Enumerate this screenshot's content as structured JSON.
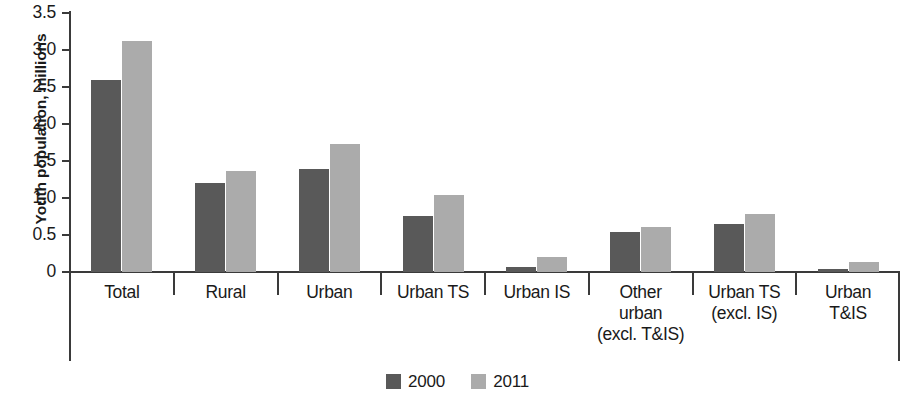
{
  "chart_data": {
    "type": "bar",
    "title": "",
    "xlabel": "",
    "ylabel": "Youth population, millions",
    "ylim": [
      0,
      3.5
    ],
    "ytick_labels": [
      "3.5",
      "3.0",
      "2.5",
      "2.0",
      "1.5",
      "1.0",
      "0.5",
      "0"
    ],
    "ytick_values": [
      3.5,
      3.0,
      2.5,
      2.0,
      1.5,
      1.0,
      0.5,
      0
    ],
    "grid": false,
    "legend_position": "bottom-center",
    "categories": [
      "Total",
      "Rural",
      "Urban",
      "Urban TS",
      "Urban IS",
      "Other\nurban\n(excl. T&IS)",
      "Urban TS\n(excl. IS)",
      "Urban\nT&IS"
    ],
    "series": [
      {
        "name": "2000",
        "color": "#595959",
        "values": [
          2.6,
          1.2,
          1.39,
          0.76,
          0.07,
          0.54,
          0.65,
          0.04
        ]
      },
      {
        "name": "2011",
        "color": "#ababab",
        "values": [
          3.12,
          1.36,
          1.73,
          1.04,
          0.2,
          0.61,
          0.79,
          0.14
        ]
      }
    ]
  },
  "legend": {
    "items": [
      {
        "label": "2000",
        "color": "#595959"
      },
      {
        "label": "2011",
        "color": "#ababab"
      }
    ]
  }
}
